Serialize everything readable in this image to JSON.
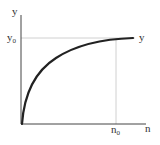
{
  "diagram": {
    "axes": {
      "y_label": "y",
      "x_label": "n",
      "axis_color": "#444444"
    },
    "reference": {
      "y0_label": "y",
      "y0_sub": "0",
      "n0_label": "n",
      "n0_sub": "0",
      "guide_color": "#bbbbbb"
    },
    "curve": {
      "end_label": "y",
      "color": "#222222",
      "shape": "concave increasing, saturating toward y0"
    }
  }
}
